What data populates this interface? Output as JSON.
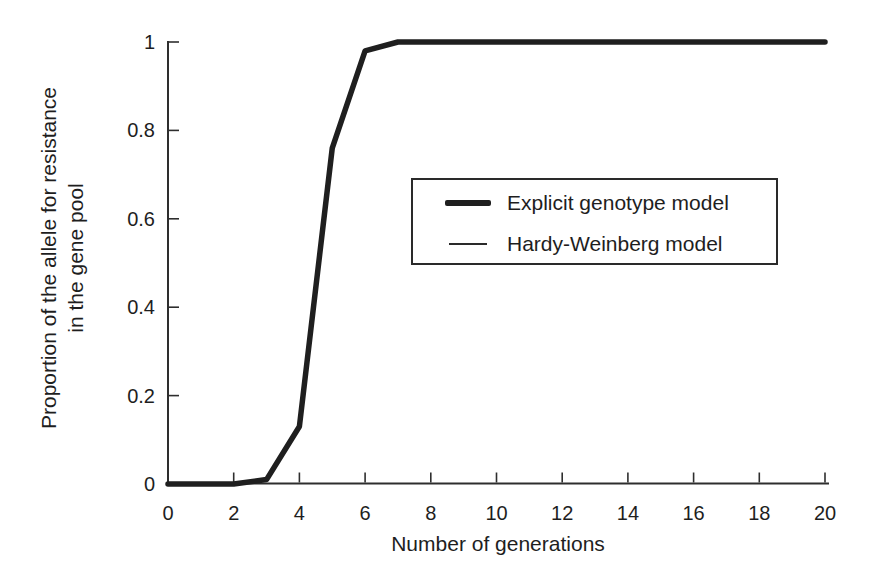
{
  "chart_data": {
    "type": "line",
    "title": "",
    "xlabel": "Number of generations",
    "ylabel_line1": "Proportion of the allele for resistance",
    "ylabel_line2": "in the gene pool",
    "xlim": [
      0,
      20
    ],
    "ylim": [
      0,
      1
    ],
    "xticks": [
      0,
      2,
      4,
      6,
      8,
      10,
      12,
      14,
      16,
      18,
      20
    ],
    "yticks": [
      0,
      0.2,
      0.4,
      0.6,
      0.8,
      1
    ],
    "ytick_labels": [
      "0",
      "0.2",
      "0.4",
      "0.6",
      "0.8",
      "1"
    ],
    "grid": "off",
    "x": [
      0,
      1,
      2,
      3,
      4,
      5,
      6,
      7,
      8,
      9,
      10,
      11,
      12,
      13,
      14,
      15,
      16,
      17,
      18,
      19,
      20
    ],
    "series": [
      {
        "name": "Hardy-Weinberg model",
        "line_weight": "thin",
        "values": [
          0,
          0,
          0,
          0.01,
          0.13,
          0.76,
          0.98,
          1,
          1,
          1,
          1,
          1,
          1,
          1,
          1,
          1,
          1,
          1,
          1,
          1,
          1
        ]
      },
      {
        "name": "Explicit genotype model",
        "line_weight": "thick",
        "values": [
          0,
          0,
          0,
          0.01,
          0.13,
          0.76,
          0.98,
          1,
          1,
          1,
          1,
          1,
          1,
          1,
          1,
          1,
          1,
          1,
          1,
          1,
          1
        ]
      }
    ],
    "legend": {
      "position": "center-right",
      "entries": [
        {
          "label": "Explicit genotype model",
          "line_weight": "thick"
        },
        {
          "label": "Hardy-Weinberg model",
          "line_weight": "thin"
        }
      ]
    },
    "colors": {
      "line": "#1f1f1f",
      "axis": "#2e2e2e",
      "text": "#1e1e1e",
      "background": "#ffffff"
    }
  }
}
